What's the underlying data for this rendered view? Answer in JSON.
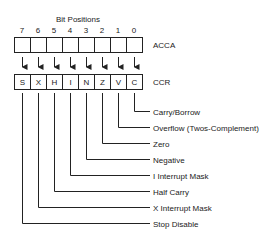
{
  "title": "Bit Positions",
  "bit_numbers": [
    "7",
    "6",
    "5",
    "4",
    "3",
    "2",
    "1",
    "0"
  ],
  "registers": {
    "acca": {
      "label": "ACCA",
      "cells": [
        "",
        "",
        "",
        "",
        "",
        "",
        "",
        ""
      ]
    },
    "ccr": {
      "label": "CCR",
      "cells": [
        "S",
        "X",
        "H",
        "I",
        "N",
        "Z",
        "V",
        "C"
      ]
    }
  },
  "flags": [
    {
      "bit": "C",
      "label": "Carry/Borrow"
    },
    {
      "bit": "V",
      "label": "Overflow (Twos-Complement)"
    },
    {
      "bit": "Z",
      "label": "Zero"
    },
    {
      "bit": "N",
      "label": "Negative"
    },
    {
      "bit": "I",
      "label": "I Interrupt Mask"
    },
    {
      "bit": "H",
      "label": "Half Carry"
    },
    {
      "bit": "X",
      "label": "X Interrupt Mask"
    },
    {
      "bit": "S",
      "label": "Stop Disable"
    }
  ]
}
